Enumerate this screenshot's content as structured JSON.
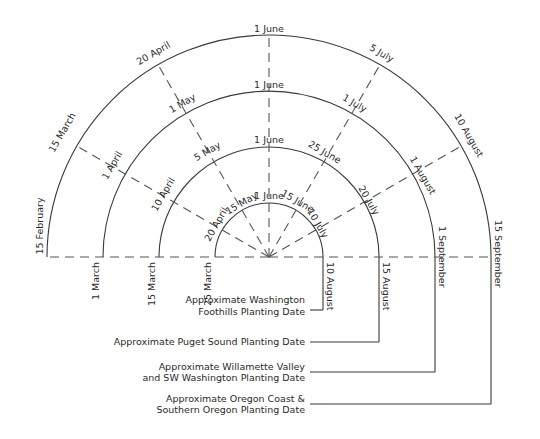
{
  "diagram": {
    "title": "",
    "center": {
      "x": 269,
      "y": 257
    },
    "rings": [
      {
        "id": "washington-foothills",
        "radius": 54,
        "legend_lines": [
          "Approximate Washington",
          "Foothills Planting Date"
        ],
        "dates": {
          "180": "25 March",
          "150": "20 April",
          "120": "15 May",
          "90": "1 June",
          "60": "15 June",
          "30": "10 July",
          "0": "10 August"
        }
      },
      {
        "id": "puget-sound",
        "radius": 110,
        "legend_lines": [
          "Approximate Puget Sound Planting Date"
        ],
        "dates": {
          "180": "15 March",
          "150": "10 April",
          "120": "5 May",
          "90": "1 June",
          "60": "25 June",
          "30": "20 July",
          "0": "15 August"
        }
      },
      {
        "id": "willamette-valley",
        "radius": 166,
        "legend_lines": [
          "Approximate Willamette Valley",
          "and SW Washington Planting Date"
        ],
        "dates": {
          "180": "1 March",
          "150": "1 April",
          "120": "1 May",
          "90": "1 June",
          "60": "1 July",
          "30": "1 August",
          "0": "1 September"
        }
      },
      {
        "id": "oregon-coast",
        "radius": 222,
        "legend_lines": [
          "Approximate Oregon Coast &",
          "Southern Oregon Planting Date"
        ],
        "dates": {
          "180": "15 February",
          "150": "15 March",
          "120": "20 April",
          "90": "1 June",
          "60": "5 July",
          "30": "10 August",
          "0": "15 September"
        }
      }
    ],
    "ray_angles_deg": [
      0,
      30,
      60,
      90,
      120,
      150,
      180
    ]
  },
  "labels": {
    "r1": {
      "a180": "25 March",
      "a150": "20 April",
      "a120": "15 May",
      "a90": "1 June",
      "a60": "15 June",
      "a30": "10 July",
      "a0": "10 August"
    },
    "r2": {
      "a180": "15 March",
      "a150": "10 April",
      "a120": "5 May",
      "a90": "1 June",
      "a60": "25 June",
      "a30": "20 July",
      "a0": "15 August"
    },
    "r3": {
      "a180": "1 March",
      "a150": "1 April",
      "a120": "1 May",
      "a90": "1 June",
      "a60": "1 July",
      "a30": "1 August",
      "a0": "1 September"
    },
    "r4": {
      "a180": "15 February",
      "a150": "15 March",
      "a120": "20 April",
      "a90": "1 June",
      "a60": "5 July",
      "a30": "10 August",
      "a0": "15 September"
    }
  },
  "legend": {
    "foothills": {
      "line1": "Approximate Washington",
      "line2": "Foothills Planting Date"
    },
    "puget": {
      "line1": "Approximate Puget Sound Planting Date"
    },
    "willamette": {
      "line1": "Approximate Willamette Valley",
      "line2": "and SW Washington Planting Date"
    },
    "coast": {
      "line1": "Approximate Oregon Coast &",
      "line2": "Southern Oregon Planting Date"
    }
  }
}
